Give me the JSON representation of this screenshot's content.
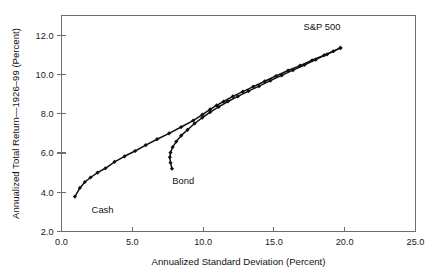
{
  "chart_data": {
    "type": "line",
    "title": "",
    "subtitle": "",
    "xlabel": "Annualized Standard Deviation (Percent)",
    "ylabel": "Annualized Total Return—1926–99 (Percent)",
    "xlim": [
      0.0,
      25.0
    ],
    "ylim": [
      2.0,
      13.0
    ],
    "xticks": [
      0.0,
      5.0,
      10.0,
      15.0,
      20.0,
      25.0
    ],
    "xticklabels": [
      "0.0",
      "5.0",
      "10.0",
      "15.0",
      "20.0",
      "25.0"
    ],
    "yticks": [
      2.0,
      4.0,
      6.0,
      8.0,
      10.0,
      12.0
    ],
    "yticklabels": [
      "2.0",
      "4.0",
      "6.0",
      "8.0",
      "10.0",
      "12.0"
    ],
    "grid": false,
    "legend": "none",
    "frame": "box",
    "line_color": "#101010",
    "marker": "filled-diamond",
    "series": [
      {
        "name": "Cash to S&P 500 frontier",
        "start_label": "Cash",
        "end_label": "S&P 500",
        "points": [
          [
            0.95,
            3.78
          ],
          [
            1.3,
            4.22
          ],
          [
            1.65,
            4.52
          ],
          [
            2.05,
            4.75
          ],
          [
            2.55,
            5.0
          ],
          [
            3.1,
            5.22
          ],
          [
            3.75,
            5.55
          ],
          [
            4.45,
            5.83
          ],
          [
            5.2,
            6.1
          ],
          [
            5.95,
            6.4
          ],
          [
            6.75,
            6.7
          ],
          [
            7.6,
            7.0
          ],
          [
            8.45,
            7.32
          ],
          [
            9.3,
            7.65
          ],
          [
            9.95,
            7.95
          ],
          [
            10.5,
            8.22
          ],
          [
            10.95,
            8.42
          ],
          [
            11.45,
            8.62
          ],
          [
            12.1,
            8.88
          ],
          [
            12.8,
            9.12
          ],
          [
            13.55,
            9.38
          ],
          [
            14.35,
            9.65
          ],
          [
            15.15,
            9.92
          ],
          [
            16.0,
            10.2
          ],
          [
            16.85,
            10.45
          ],
          [
            17.7,
            10.72
          ],
          [
            18.55,
            10.98
          ],
          [
            19.2,
            11.18
          ],
          [
            19.7,
            11.35
          ]
        ]
      },
      {
        "name": "Bond to S&P 500 frontier",
        "start_label": "Bond",
        "end_label": "S&P 500",
        "points": [
          [
            7.8,
            5.2
          ],
          [
            7.7,
            5.5
          ],
          [
            7.65,
            5.78
          ],
          [
            7.7,
            6.02
          ],
          [
            7.85,
            6.3
          ],
          [
            8.1,
            6.58
          ],
          [
            8.45,
            6.88
          ],
          [
            8.9,
            7.18
          ],
          [
            9.4,
            7.5
          ],
          [
            9.95,
            7.8
          ],
          [
            10.5,
            8.08
          ],
          [
            11.1,
            8.35
          ],
          [
            11.75,
            8.62
          ],
          [
            12.45,
            8.88
          ],
          [
            13.2,
            9.15
          ],
          [
            13.95,
            9.4
          ],
          [
            14.75,
            9.68
          ],
          [
            15.55,
            9.95
          ],
          [
            16.35,
            10.22
          ],
          [
            17.15,
            10.48
          ],
          [
            17.95,
            10.75
          ],
          [
            18.75,
            11.02
          ],
          [
            19.7,
            11.35
          ]
        ]
      }
    ],
    "annotations": [
      {
        "text": "S&P 500",
        "x": 18.4,
        "y": 12.25,
        "anchor": "middle"
      },
      {
        "text": "Bond",
        "x": 8.6,
        "y": 4.4,
        "anchor": "middle"
      },
      {
        "text": "Cash",
        "x": 2.9,
        "y": 2.95,
        "anchor": "middle"
      }
    ]
  }
}
